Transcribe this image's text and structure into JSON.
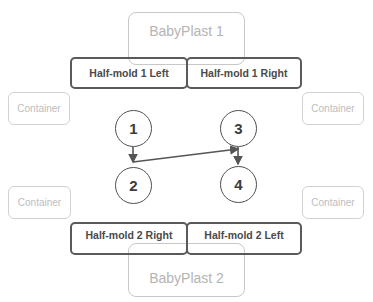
{
  "machines": [
    {
      "label": "BabyPlast 1"
    },
    {
      "label": "BabyPlast 2"
    }
  ],
  "half_molds": {
    "top": [
      {
        "label": "Half-mold 1 Left"
      },
      {
        "label": "Half-mold 1 Right"
      }
    ],
    "bottom": [
      {
        "label": "Half-mold 2 Right"
      },
      {
        "label": "Half-mold 2 Left"
      }
    ]
  },
  "containers": [
    {
      "label": "Container"
    },
    {
      "label": "Container"
    },
    {
      "label": "Container"
    },
    {
      "label": "Container"
    }
  ],
  "nodes": [
    {
      "label": "1"
    },
    {
      "label": "2"
    },
    {
      "label": "3"
    },
    {
      "label": "4"
    }
  ],
  "edges": [
    {
      "from": "1",
      "to": "2"
    },
    {
      "from": "2",
      "to": "3"
    },
    {
      "from": "3",
      "to": "4"
    }
  ],
  "colors": {
    "machine_border": "#c8c8c8",
    "halfmold_border": "#5a5a5a",
    "container_border": "#d2d2d2",
    "node_border": "#505050"
  }
}
